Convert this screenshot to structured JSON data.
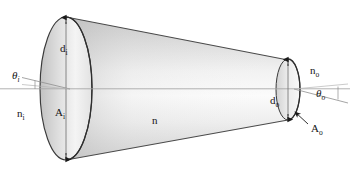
{
  "figure": {
    "background_color": "#ffffff",
    "outline_color": "#3a3a3a",
    "axis_color": "#9a9a9a",
    "label_color": "#141414",
    "body_fill_light": "#fdfdfd",
    "body_fill_mid": "#e3e3e3",
    "body_fill_dark": "#c9c9c9",
    "cap_fill_light": "#ffffff",
    "cap_fill_dark": "#bdbdbd"
  },
  "labels": {
    "d_in": {
      "base": "d",
      "sub": "i"
    },
    "d_out": {
      "base": "d",
      "sub": "o"
    },
    "a_in": {
      "base": "A",
      "sub": "i"
    },
    "a_out": {
      "base": "A",
      "sub": "o"
    },
    "n_in": {
      "base": "n",
      "sub": "i"
    },
    "n_out": {
      "base": "n",
      "sub": "o"
    },
    "n_med": {
      "base": "n",
      "sub": ""
    },
    "theta_in": {
      "base": "θ",
      "sub": "i"
    },
    "theta_out": {
      "base": "θ",
      "sub": "o"
    }
  },
  "elements": {
    "left_cap": "input-aperture-ellipse",
    "right_cap": "output-aperture-ellipse",
    "body": "cone-body",
    "axis": "optical-axis-line",
    "d_in_arrow": "input-diameter-arrow",
    "d_out_arrow": "output-diameter-arrow",
    "theta_in_rays": "input-angle-rays",
    "theta_out_rays": "output-angle-rays",
    "a_out_leader": "output-area-leader-arrow"
  }
}
